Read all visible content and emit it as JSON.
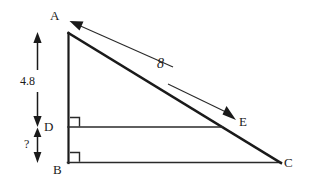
{
  "figure": {
    "type": "geometry-diagram",
    "background_color": "#ffffff",
    "stroke_color": "#1a1a1a",
    "vertices": [
      {
        "id": "A",
        "label": "A",
        "x": 68,
        "y": 33
      },
      {
        "id": "B",
        "label": "B",
        "x": 68,
        "y": 163
      },
      {
        "id": "C",
        "label": "C",
        "x": 281,
        "y": 163
      },
      {
        "id": "D",
        "label": "D",
        "x": 68,
        "y": 127
      },
      {
        "id": "E",
        "label": "E",
        "x": 222,
        "y": 127
      }
    ],
    "segments": [
      {
        "name": "AB",
        "from": "A",
        "to": "B",
        "width": 2.2
      },
      {
        "name": "BC",
        "from": "B",
        "to": "C",
        "width": 1.6
      },
      {
        "name": "AC",
        "from": "A",
        "to": "C",
        "width": 2.4
      },
      {
        "name": "DE",
        "from": "D",
        "to": "E",
        "width": 1.6
      }
    ],
    "right_angles": [
      {
        "at": "D",
        "label": "right-angle-mark-d"
      },
      {
        "at": "B",
        "label": "right-angle-mark-b"
      }
    ],
    "side_labels": [
      {
        "name": "hypotenuse-length",
        "text": "8",
        "for": "AC"
      }
    ],
    "dimensions": [
      {
        "name": "dimension-a-to-d",
        "text": "4.8",
        "from_y": 33,
        "to_y": 127,
        "x": 37
      },
      {
        "name": "dimension-d-to-b",
        "text": "?",
        "from_y": 127,
        "to_y": 163,
        "x": 37
      }
    ],
    "annotation_arrows": [
      {
        "name": "arrow-to-a",
        "desc": "leader arrow pointing to vertex A"
      },
      {
        "name": "arrow-to-e",
        "desc": "leader arrow pointing to point E"
      }
    ]
  }
}
